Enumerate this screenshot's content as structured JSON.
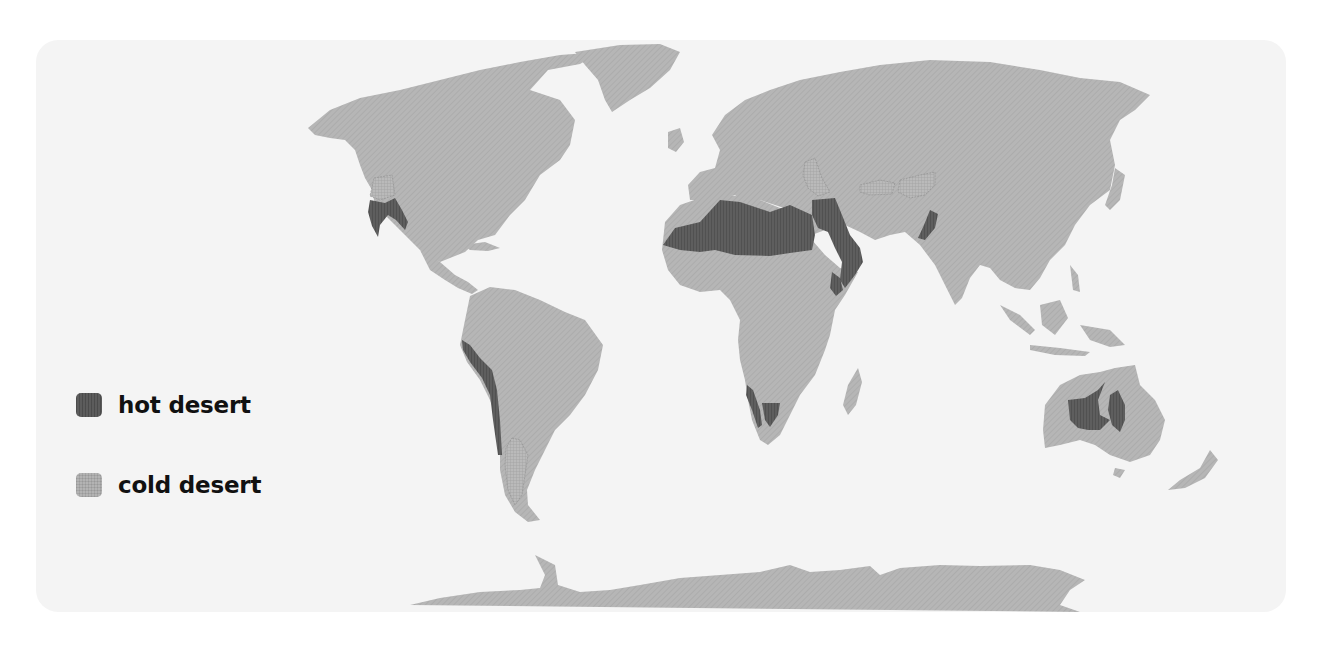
{
  "map": {
    "type": "world-map",
    "subject": "distribution of deserts",
    "colors": {
      "background": "#ffffff",
      "panel": "#f4f4f4",
      "land": "#b4b4b4",
      "hot_desert": "#5a5a5a",
      "cold_desert": "#b0b0b0",
      "text": "#111111"
    }
  },
  "legend": {
    "items": [
      {
        "key": "hot",
        "label": "hot desert",
        "color": "#5a5a5a"
      },
      {
        "key": "cold",
        "label": "cold desert",
        "color": "#b0b0b0"
      }
    ]
  },
  "regions": {
    "hot_desert": [
      "Sonoran/Mojave (SW USA & Mexico)",
      "Atacama (west coast South America)",
      "Sahara",
      "Arabian",
      "Thar",
      "Namib",
      "Kalahari",
      "Australian interior"
    ],
    "cold_desert": [
      "Great Basin (USA)",
      "Patagonia",
      "Central Asian (Kazakh/Karakum)",
      "Taklamakan",
      "Gobi"
    ]
  }
}
